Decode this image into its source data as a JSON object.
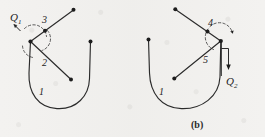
{
  "figure": {
    "caption": "(b)",
    "background_color": "#f3f2f0",
    "ink_color": "#2a2a2a",
    "panels": [
      {
        "id": "left",
        "torque_label": "Q",
        "torque_subscript": "1",
        "link_labels": [
          "3",
          "2",
          "1"
        ]
      },
      {
        "id": "right",
        "torque_label": "Q",
        "torque_subscript": "2",
        "link_labels": [
          "4",
          "5",
          "1"
        ]
      }
    ]
  },
  "left_panel": {
    "label_3": "3",
    "label_2": "2",
    "label_1": "1",
    "torque": "Q",
    "torque_sub": "1"
  },
  "right_panel": {
    "label_4": "4",
    "label_5": "5",
    "label_1": "1",
    "torque": "Q",
    "torque_sub": "2"
  },
  "ghost_text": "              \n"
}
